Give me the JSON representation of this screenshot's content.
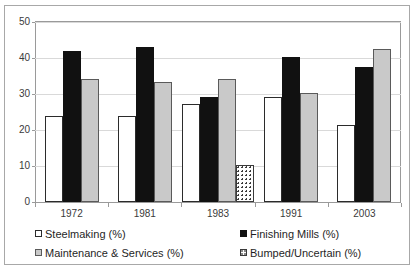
{
  "chart_data": {
    "type": "bar",
    "title": "",
    "subtitle": "",
    "xlabel": "",
    "ylabel": "",
    "categories": [
      "1972",
      "1981",
      "1983",
      "1991",
      "2003"
    ],
    "series": [
      {
        "name": "Steelmaking (%)",
        "swatch": "white-outlined",
        "color": "#ffffff",
        "values": [
          24,
          24,
          27.2,
          29.2,
          21.4
        ]
      },
      {
        "name": "Finishing Mills (%)",
        "swatch": "black-solid",
        "color": "#111111",
        "values": [
          42,
          43,
          29.2,
          40.3,
          37.4
        ]
      },
      {
        "name": "Maintenance & Services (%)",
        "swatch": "gray-solid",
        "color": "#c9c9c9",
        "values": [
          34.1,
          33.2,
          34.3,
          30.3,
          42.4
        ]
      },
      {
        "name": "Bumped/Uncertain (%)",
        "swatch": "dotted",
        "color": "#ffffff",
        "values": [
          null,
          null,
          10.2,
          null,
          null
        ]
      }
    ],
    "ylim": [
      0,
      50
    ],
    "yticks": [
      0,
      10,
      20,
      30,
      40,
      50
    ],
    "ytick_labels": [
      "0",
      "10",
      "20",
      "30",
      "40",
      "50"
    ],
    "grid": true,
    "grid_axis": "y",
    "legend_position": "bottom",
    "legend_columns": 2,
    "legend_order": [
      "Steelmaking (%)",
      "Finishing Mills (%)",
      "Maintenance & Services (%)",
      "Bumped/Uncertain (%)"
    ]
  },
  "axis": {
    "y_tick_labels": [
      "50",
      "40",
      "30",
      "20",
      "10",
      "0"
    ]
  }
}
